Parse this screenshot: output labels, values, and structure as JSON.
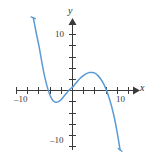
{
  "figure": {
    "background_color": "#ffffff",
    "axis_color": "#3a3a3a",
    "curve_color": "#5b9bd5"
  },
  "labels": {
    "axis_x_name": "x",
    "axis_y_name": "y",
    "x_neg10": "–10",
    "x_pos10": "10",
    "y_pos10": "10",
    "y_neg10": "–10"
  },
  "chart_data": {
    "type": "line",
    "title": "",
    "xlabel": "x",
    "ylabel": "y",
    "xlim": [
      -12,
      12
    ],
    "ylim": [
      -12,
      12
    ],
    "xticks": [
      -10,
      10
    ],
    "yticks": [
      10,
      -10
    ],
    "xtick_labels": [
      "–10",
      "10"
    ],
    "ytick_labels": [
      "10",
      "–10"
    ],
    "grid": false,
    "legend": null,
    "series": [
      {
        "name": "cubic",
        "description": "Cubic polynomial with negative leading coefficient; rises to the upper left and falls to the lower right.",
        "roots": [
          -5,
          0,
          7
        ],
        "local_minimum": [
          -3,
          -2
        ],
        "local_maximum": [
          4,
          3
        ],
        "x": [
          -7.0,
          -6.5,
          -6.0,
          -5.5,
          -5.0,
          -4.5,
          -4.0,
          -3.5,
          -3.0,
          -2.5,
          -2.0,
          -1.5,
          -1.0,
          -0.5,
          0.0,
          0.5,
          1.0,
          1.5,
          2.0,
          2.5,
          3.0,
          3.5,
          4.0,
          4.5,
          5.0,
          5.5,
          6.0,
          6.5,
          7.0,
          7.5,
          8.0,
          8.5
        ],
        "y": [
          13.0,
          10.4,
          8.0,
          5.2,
          2.6,
          0.6,
          -0.9,
          -1.8,
          -2.1,
          -2.0,
          -1.6,
          -1.0,
          -0.4,
          0.2,
          0.6,
          1.2,
          1.8,
          2.3,
          2.7,
          3.0,
          3.2,
          3.2,
          3.1,
          2.7,
          2.1,
          1.3,
          0.2,
          -1.2,
          -2.9,
          -5.0,
          -7.6,
          -10.6
        ]
      }
    ]
  }
}
